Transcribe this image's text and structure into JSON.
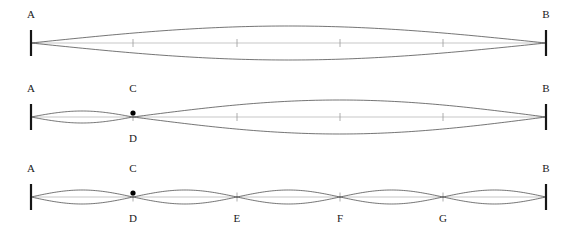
{
  "figure": {
    "background_color": "#ffffff",
    "curve_color": "#3a3a3a",
    "axis_color": "#b9b9b9",
    "endpoint_color": "#161616",
    "tick_color": "#9a9a9a",
    "dot_color": "#000000",
    "label_color": "#1a1a1a",
    "string_left_x": 31,
    "string_right_x": 546
  },
  "chart_data": {
    "type": "line",
    "xlabel": "",
    "ylabel": "",
    "panels": [
      {
        "id": "panel-1",
        "name": "fundamental-mode",
        "harmonic": 1,
        "lobes": 1,
        "baseline_y": 43,
        "amplitude": 17,
        "endpoints": [
          {
            "label": "A",
            "x": 31,
            "position": "above"
          },
          {
            "label": "B",
            "x": 546,
            "position": "above"
          }
        ],
        "interior_nodes": [],
        "node_dots": [],
        "axis_ticks": [
          133,
          237,
          340,
          443
        ],
        "envelope": "single half-sine lobe spanning A to B, drawn as upper and lower envelope"
      },
      {
        "id": "panel-2",
        "name": "mixed-mode",
        "harmonic": 2,
        "lobes": 2,
        "baseline_y": 117,
        "amplitude_left": 6,
        "amplitude_right": 17,
        "endpoints": [
          {
            "label": "A",
            "x": 31,
            "position": "above"
          },
          {
            "label": "B",
            "x": 546,
            "position": "above"
          }
        ],
        "interior_nodes": [
          {
            "label_above": "C",
            "label_below": "D",
            "x": 133
          }
        ],
        "node_dots": [
          133
        ],
        "axis_ticks": [
          237,
          340,
          443
        ],
        "envelope": "small lobe from A to node at x=133, large lobe from node to B"
      },
      {
        "id": "panel-3",
        "name": "fifth-harmonic-mode",
        "harmonic": 5,
        "lobes": 5,
        "baseline_y": 197,
        "amplitude": 7,
        "endpoints": [
          {
            "label": "A",
            "x": 31,
            "position": "above"
          },
          {
            "label": "B",
            "x": 546,
            "position": "above"
          }
        ],
        "interior_nodes": [
          {
            "label_above": "C",
            "label_below": "D",
            "x": 133
          },
          {
            "label_above": "",
            "label_below": "E",
            "x": 237
          },
          {
            "label_above": "",
            "label_below": "F",
            "x": 340
          },
          {
            "label_above": "",
            "label_below": "G",
            "x": 443
          }
        ],
        "node_dots": [
          133
        ],
        "axis_ticks": [
          133,
          237,
          340,
          443
        ],
        "envelope": "five equal half-sine lobes between A and B"
      }
    ]
  },
  "labels": [
    {
      "id": "p1-A",
      "text": "A",
      "x": 31,
      "y": 9
    },
    {
      "id": "p1-B",
      "text": "B",
      "x": 546,
      "y": 9
    },
    {
      "id": "p2-A",
      "text": "A",
      "x": 31,
      "y": 83
    },
    {
      "id": "p2-B",
      "text": "B",
      "x": 546,
      "y": 83
    },
    {
      "id": "p2-C",
      "text": "C",
      "x": 133,
      "y": 83
    },
    {
      "id": "p2-D",
      "text": "D",
      "x": 133,
      "y": 133
    },
    {
      "id": "p3-A",
      "text": "A",
      "x": 31,
      "y": 163
    },
    {
      "id": "p3-B",
      "text": "B",
      "x": 546,
      "y": 163
    },
    {
      "id": "p3-C",
      "text": "C",
      "x": 133,
      "y": 163
    },
    {
      "id": "p3-D",
      "text": "D",
      "x": 133,
      "y": 213
    },
    {
      "id": "p3-E",
      "text": "E",
      "x": 237,
      "y": 213
    },
    {
      "id": "p3-F",
      "text": "F",
      "x": 340,
      "y": 213
    },
    {
      "id": "p3-G",
      "text": "G",
      "x": 443,
      "y": 213
    }
  ]
}
